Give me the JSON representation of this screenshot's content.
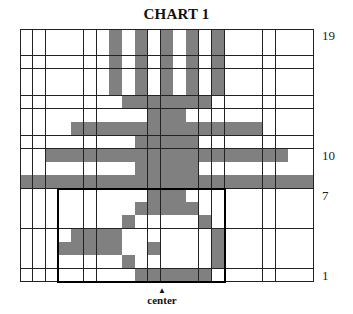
{
  "title": "CHART 1",
  "grid": {
    "columns": 23,
    "rows": 19,
    "fill_color": "#808080",
    "empty_color": "#ffffff",
    "filled_cells_by_row": {
      "19": [
        7,
        9,
        11,
        13,
        15
      ],
      "18": [
        7,
        9,
        11,
        13,
        15
      ],
      "17": [
        7,
        9,
        11,
        13,
        15
      ],
      "16": [
        7,
        9,
        11,
        13,
        15
      ],
      "15": [
        7,
        9,
        11,
        13,
        15
      ],
      "14": [
        8,
        9,
        10,
        11,
        12,
        13,
        14
      ],
      "13": [
        10,
        11,
        12
      ],
      "12": [
        4,
        5,
        6,
        7,
        8,
        9,
        10,
        11,
        12,
        13,
        14,
        15,
        16,
        17,
        18
      ],
      "11": [
        9,
        10,
        11,
        12,
        13
      ],
      "10": [
        2,
        3,
        4,
        5,
        6,
        7,
        8,
        9,
        10,
        11,
        12,
        13,
        14,
        15,
        16,
        17,
        18,
        19,
        20
      ],
      "9": [
        9,
        10,
        11,
        12,
        13
      ],
      "8": [
        0,
        1,
        2,
        3,
        4,
        5,
        6,
        7,
        8,
        9,
        10,
        11,
        12,
        13,
        14,
        15,
        16,
        17,
        18,
        19,
        20,
        21,
        22
      ],
      "7": [
        10,
        11,
        12
      ],
      "6": [
        9,
        10,
        11,
        12,
        13
      ],
      "5": [
        8,
        14
      ],
      "4": [
        4,
        5,
        6,
        7,
        15
      ],
      "3": [
        3,
        4,
        5,
        6,
        7,
        10,
        15
      ],
      "2": [
        8,
        15
      ],
      "1": [
        9,
        10,
        11,
        12,
        13,
        14
      ]
    },
    "outlined_box": {
      "col_start": 3,
      "col_end": 15,
      "row_start": 1,
      "row_end": 7
    }
  },
  "row_labels": [
    {
      "row": 19,
      "text": "19"
    },
    {
      "row": 10,
      "text": "10"
    },
    {
      "row": 7,
      "text": "7"
    },
    {
      "row": 1,
      "text": "1"
    }
  ],
  "center_marker": {
    "arrow": "▲",
    "label": "center"
  }
}
